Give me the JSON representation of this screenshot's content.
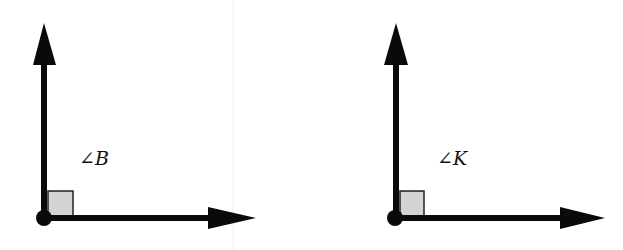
{
  "figures": [
    {
      "id": "angle-b",
      "label": "∠B",
      "vertex": [
        44,
        218
      ],
      "up_tip": [
        44,
        23
      ],
      "right_tip": [
        256,
        218
      ],
      "right_angle_marker": true
    },
    {
      "id": "angle-k",
      "label": "∠K",
      "vertex": [
        396,
        218
      ],
      "up_tip": [
        396,
        23
      ],
      "right_tip": [
        605,
        218
      ],
      "right_angle_marker": true
    }
  ],
  "colors": {
    "stroke": "#0a0a0a",
    "marker_fill": "#d3d3d3",
    "marker_stroke": "#222222",
    "faint_divider": "#eeeeee",
    "background": "#ffffff"
  }
}
